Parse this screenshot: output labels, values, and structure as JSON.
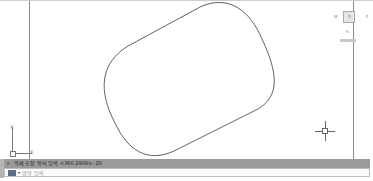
{
  "viewcube": {
    "north_label": "N",
    "west_label": "W",
    "east_label": "E",
    "face_label": "위",
    "south_label": "S",
    "wcs_label": "WCS"
  },
  "ucs_icon": {
    "y_label": "Y",
    "x_label": "X"
  },
  "command_line": {
    "close_glyph": "×",
    "history_text": "객체 조정 형식 입력 <360.2909>: 20",
    "input_placeholder": "명령 입력",
    "dropdown_glyph": "▾"
  },
  "drawing": {
    "shape": "rounded-rectangle (filleted, rotated)",
    "stroke_color": "#3a3a3a"
  }
}
